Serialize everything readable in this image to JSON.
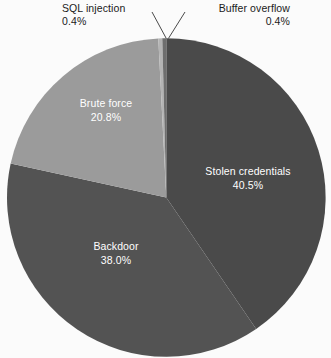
{
  "chart_data": {
    "type": "pie",
    "title": "",
    "subtitle": "",
    "xlabel": "",
    "ylabel": "",
    "legend_position": "none",
    "grid": false,
    "labels_show_percent": true,
    "categories": [
      "Stolen credentials",
      "Backdoor",
      "Brute force",
      "SQL injection",
      "Buffer overflow"
    ],
    "values": [
      40.5,
      38.0,
      20.8,
      0.4,
      0.4
    ],
    "value_labels": [
      "40.5%",
      "38.0%",
      "20.8%",
      "0.4%",
      "0.4%"
    ],
    "colors": [
      "#4a4a4a",
      "#535353",
      "#9b9b9b",
      "#b4b4b4",
      "#6e6e6e"
    ],
    "label_placement": [
      "inside",
      "inside",
      "inside",
      "outside",
      "outside"
    ],
    "slices": [
      {
        "name": "Stolen credentials",
        "percent": "40.5%",
        "value": 40.5,
        "color": "#4a4a4a",
        "text_color": "#ffffff",
        "placement": "inside"
      },
      {
        "name": "Backdoor",
        "percent": "38.0%",
        "value": 38.0,
        "color": "#535353",
        "text_color": "#ffffff",
        "placement": "inside"
      },
      {
        "name": "Brute force",
        "percent": "20.8%",
        "value": 20.8,
        "color": "#9b9b9b",
        "text_color": "#ffffff",
        "placement": "inside"
      },
      {
        "name": "SQL injection",
        "percent": "0.4%",
        "value": 0.4,
        "color": "#b4b4b4",
        "text_color": "#1a1a1a",
        "placement": "outside"
      },
      {
        "name": "Buffer overflow",
        "percent": "0.4%",
        "value": 0.4,
        "color": "#6e6e6e",
        "text_color": "#1a1a1a",
        "placement": "outside"
      }
    ]
  },
  "labels": {
    "sql_injection": {
      "name": "SQL injection",
      "percent": "0.4%"
    },
    "buffer_overflow": {
      "name": "Buffer overflow",
      "percent": "0.4%"
    },
    "brute_force": {
      "name": "Brute force",
      "percent": "20.8%"
    },
    "stolen_credentials": {
      "name": "Stolen credentials",
      "percent": "40.5%"
    },
    "backdoor": {
      "name": "Backdoor",
      "percent": "38.0%"
    }
  },
  "style": {
    "background": "#fbfbfb",
    "leader_line_color": "#4a4a4a",
    "inside_text_color": "#ffffff",
    "outside_text_color": "#1a1a1a"
  }
}
